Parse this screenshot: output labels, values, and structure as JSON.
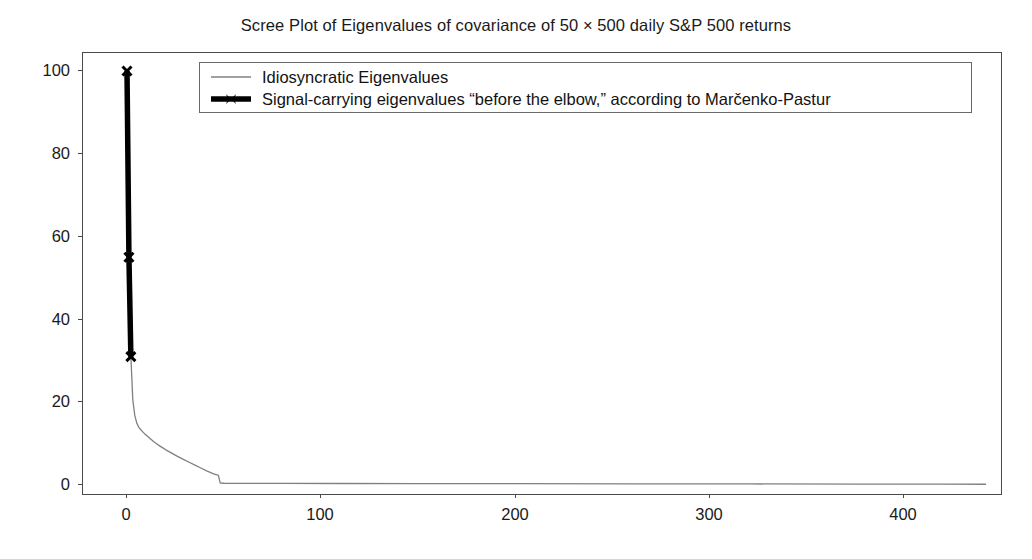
{
  "figure": {
    "width": 1032,
    "height": 559,
    "background": "#ffffff"
  },
  "chart_data": {
    "type": "line",
    "title": "Scree Plot of Eigenvalues of covariance of 50 × 500 daily S&P 500 returns",
    "xlabel": "",
    "ylabel": "",
    "xlim": [
      -10,
      450
    ],
    "ylim": [
      -3,
      107
    ],
    "grid": false,
    "legend_position": "upper center",
    "xticks": [
      0,
      100,
      200,
      300,
      400
    ],
    "xtick_labels": [
      "0",
      "100",
      "200",
      "300",
      "400"
    ],
    "yticks": [
      0,
      20,
      40,
      60,
      80,
      100
    ],
    "ytick_labels": [
      "0",
      "20",
      "40",
      "60",
      "80",
      "100"
    ],
    "series": [
      {
        "name": "Idiosyncratic Eigenvalues",
        "color": "#808080",
        "linewidth": 1,
        "style": "thin-line",
        "x": [
          0,
          1,
          2,
          3,
          4,
          5,
          6,
          7,
          8,
          9,
          10,
          12,
          14,
          16,
          18,
          20,
          23,
          26,
          29,
          32,
          35,
          38,
          41,
          44,
          45,
          46,
          47,
          48,
          50,
          60,
          80,
          110,
          150,
          200,
          260,
          320,
          380,
          420,
          442
        ],
        "y": [
          100.0,
          55.0,
          31.0,
          20.5,
          16.8,
          15.0,
          14.0,
          13.4,
          12.9,
          12.4,
          12.0,
          11.2,
          10.4,
          9.7,
          9.1,
          8.5,
          7.7,
          6.9,
          6.2,
          5.5,
          4.8,
          4.1,
          3.4,
          2.8,
          2.6,
          2.5,
          2.4,
          0.45,
          0.42,
          0.4,
          0.38,
          0.36,
          0.34,
          0.31,
          0.28,
          0.25,
          0.22,
          0.2,
          0.18
        ]
      },
      {
        "name": "Signal-carrying eigenvalues “before the elbow,” according to Marčenko-Pastur",
        "color": "#000000",
        "linewidth": 5,
        "style": "thick-line-with-markers",
        "x": [
          0,
          1,
          2
        ],
        "y": [
          100.0,
          55.0,
          31.0
        ]
      }
    ],
    "annotations": {
      "elbow_index": 47,
      "elbow_note": "sharp drop to near-zero after index ~47"
    }
  },
  "legend": {
    "entries": [
      {
        "label": "Idiosyncratic Eigenvalues",
        "sample": "thin-gray-line",
        "color": "#808080"
      },
      {
        "label": "Signal-carrying eigenvalues “before the elbow,” according to Marčenko-Pastur",
        "sample": "thick-black-line",
        "color": "#000000"
      }
    ]
  },
  "axis": {
    "y_labels": [
      "100",
      "80",
      "60",
      "40",
      "20",
      "0"
    ],
    "x_labels": [
      "0",
      "100",
      "200",
      "300",
      "400"
    ]
  }
}
